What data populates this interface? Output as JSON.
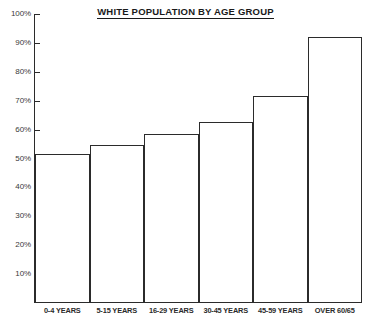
{
  "chart_data": {
    "type": "bar",
    "title": "WHITE POPULATION BY AGE GROUP",
    "xlabel": "",
    "ylabel": "",
    "ylim": [
      0,
      100
    ],
    "grid": false,
    "legend": "none",
    "y_tick_labels": [
      "100%",
      "90%",
      "80%",
      "70%",
      "60%",
      "50%",
      "40%",
      "30%",
      "20%",
      "10%"
    ],
    "y_tick_values": [
      100,
      90,
      80,
      70,
      60,
      50,
      40,
      30,
      20,
      10
    ],
    "categories": [
      "0-4 YEARS",
      "5-15 YEARS",
      "16-29 YEARS",
      "30-45 YEARS",
      "45-59 YEARS",
      "OVER 60/65"
    ],
    "values": [
      51.5,
      54.5,
      58.5,
      62.5,
      71.5,
      92
    ],
    "series": [
      {
        "name": "White population share",
        "values": [
          51.5,
          54.5,
          58.5,
          62.5,
          71.5,
          92
        ]
      }
    ],
    "colors": {
      "bar_fill": "#ffffff",
      "bar_outline": "#2b2b2b",
      "axis": "#2b2b2b",
      "text": "#1a1a1a",
      "background": "#ffffff"
    }
  }
}
